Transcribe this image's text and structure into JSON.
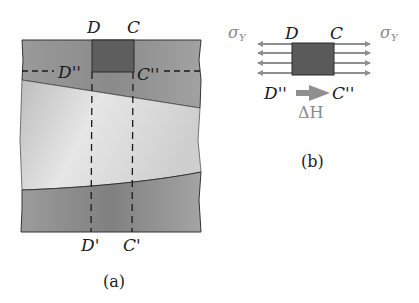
{
  "figure": {
    "panel_a": {
      "caption": "(a)",
      "labels": {
        "top_left": "D",
        "top_right": "C",
        "mid_left": "D''",
        "mid_right": "C''",
        "bottom_left": "D'",
        "bottom_right": "C'"
      }
    },
    "panel_b": {
      "caption": "(b)",
      "labels": {
        "stress_left": "σ",
        "stress_left_sub": "Y",
        "stress_right": "σ",
        "stress_right_sub": "Y",
        "top_left": "D",
        "top_right": "C",
        "bottom_left": "D''",
        "bottom_right": "C''",
        "displacement": "ΔH"
      }
    },
    "colors": {
      "background": "#ffffff",
      "band_dark": "#8c8c8c",
      "band_light": "#c8c8c8",
      "element_square": "#5a5a5a",
      "arrow_grey": "#8f8f8f",
      "line": "#222222"
    }
  }
}
